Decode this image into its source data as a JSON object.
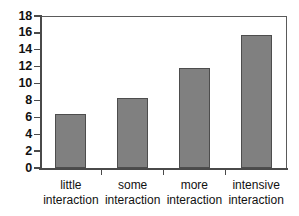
{
  "chart_data": {
    "type": "bar",
    "title": "",
    "subtitle": "",
    "xlabel": "",
    "ylabel": "",
    "categories": [
      "little interaction",
      "some interaction",
      "more interaction",
      "intensive interaction"
    ],
    "category_lines": [
      [
        "little",
        "interaction"
      ],
      [
        "some",
        "interaction"
      ],
      [
        "more",
        "interaction"
      ],
      [
        "intensive",
        "interaction"
      ]
    ],
    "values": [
      6.4,
      8.3,
      11.8,
      15.7
    ],
    "ylim": [
      0,
      18
    ],
    "ytick_values": [
      0,
      2,
      4,
      6,
      8,
      10,
      12,
      14,
      16,
      18
    ],
    "ytick_labels": [
      "0",
      "2",
      "4",
      "6",
      "8",
      "10",
      "12",
      "14",
      "16",
      "18"
    ],
    "grid": false,
    "legend": null,
    "bar_color": "#808080",
    "bar_edge_color": "#4d4d4d",
    "axis_color": "#4a4a4a",
    "frame_color": "#5a5a5a",
    "background_color": "#ffffff"
  }
}
